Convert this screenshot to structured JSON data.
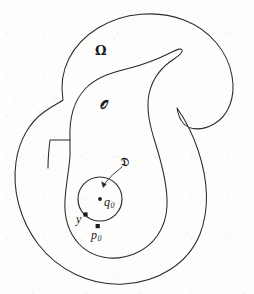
{
  "figure": {
    "kind": "mathematical-diagram",
    "caption": "",
    "background_color": "#fdfdfc",
    "stroke_color": "#2a2a2a",
    "width": 254,
    "height": 294
  },
  "labels": {
    "outer_domain": "Ω",
    "inner_open_set": "𝒪",
    "disc": "𝔇",
    "center_point": "q",
    "center_point_sub": "0",
    "tangency_point": "y",
    "boundary_point": "p",
    "boundary_point_sub": "0"
  },
  "geometry": {
    "outer_boundary_name": "omega-boundary",
    "inner_boundary_name": "open-set-boundary",
    "disc": {
      "center_x": 100,
      "center_y": 199,
      "radius": 22
    },
    "points": [
      {
        "name": "q0",
        "x": 100,
        "y": 199
      },
      {
        "name": "y",
        "x": 85.5,
        "y": 214.5
      },
      {
        "name": "p0",
        "x": 97.5,
        "y": 226
      }
    ],
    "arrow": {
      "name": "disc-callout-arrow",
      "from_x": 123,
      "from_y": 166,
      "to_x": 103,
      "to_y": 186
    }
  },
  "paths": {
    "outer_boundary": "M 56 120 C 54 72 74 40 104 24 C 134 8 172 10 196 24 C 220 38 234 62 232 86 C 230 106 214 118 200 120 C 188 122 180 118 176 114 C 182 122 190 136 194 154 C 200 180 200 206 190 230 C 178 258 150 276 118 278 C 84 280 54 266 36 240 C 20 216 14 186 18 160 C 22 138 34 126 46 124 C 50 123 54 122 56 120 Z",
    "inner_boundary": "M 83 126 C 80 110 84 98 92 92 C 100 86 110 84 120 80 C 134 74 148 64 162 56 C 168 52 172 50 174 52 C 175 53 174 55 170 58 C 156 68 146 78 142 90 C 138 104 140 120 144 136 C 150 158 158 178 158 196 C 158 216 148 232 132 240 C 116 248 98 246 88 236 C 80 228 76 216 76 204 C 76 190 80 178 82 166 C 84 152 85 138 83 126 Z"
  }
}
